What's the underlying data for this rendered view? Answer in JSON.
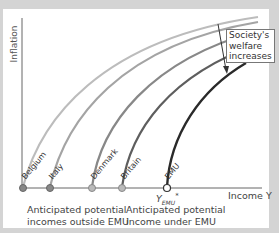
{
  "axes": {
    "y_label": "Inflation",
    "x_label": "Income Y"
  },
  "curves": [
    {
      "label": "Belgium",
      "color": "#bcbcbc"
    },
    {
      "label": "Italy",
      "color": "#a4a4a4"
    },
    {
      "label": "Denmark",
      "color": "#888888"
    },
    {
      "label": "Britain",
      "color": "#5e5e5e"
    },
    {
      "label": "EMU",
      "color": "#2a2a2a"
    }
  ],
  "annotation": {
    "line1": "Society's",
    "line2": "welfare",
    "line3": "increases"
  },
  "x_marker": {
    "symbol": "Y",
    "subscript": "EMU",
    "superscript": "*"
  },
  "captions": {
    "outside_line1": "Anticipated potential",
    "outside_line2": "incomes outside EMU",
    "under_line1": "Anticipated potential",
    "under_line2": "income under EMU"
  }
}
